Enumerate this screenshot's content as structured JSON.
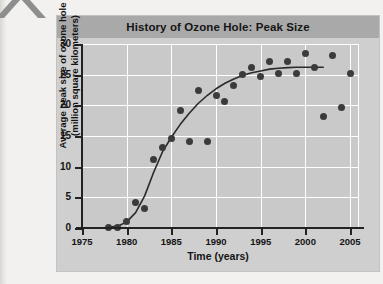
{
  "figure": {
    "title": "History of Ozone Hole: Peak Size",
    "title_band_color": "#a9a9a9",
    "panel_color": "#cfcfcf",
    "plot_color": "#c9c9c9",
    "grid_color": "#ffffff",
    "axis_color": "#222222",
    "marker_color": "#3b3b3b",
    "curve_color": "#2a2a2a"
  },
  "chart_data": {
    "type": "scatter",
    "title": "History of Ozone Hole: Peak Size",
    "xlabel": "Time (years)",
    "ylabel": "Average peak size of ozone hole\n(million square kilometers)",
    "xlim": [
      1975,
      2006
    ],
    "ylim": [
      0,
      30
    ],
    "xticks": [
      1975,
      1980,
      1985,
      1990,
      1995,
      2000,
      2005
    ],
    "yticks": [
      0,
      5,
      10,
      15,
      20,
      25,
      30
    ],
    "xtick_labels": [
      "1975",
      "1980",
      "1985",
      "1990",
      "1995",
      "2000",
      "2005"
    ],
    "ytick_labels": [
      "0",
      "5",
      "10",
      "15",
      "20",
      "25",
      "30"
    ],
    "grid": true,
    "legend": false,
    "series": [
      {
        "name": "Average peak size of ozone hole",
        "x": [
          1978,
          1979,
          1980,
          1981,
          1982,
          1983,
          1984,
          1985,
          1986,
          1987,
          1988,
          1989,
          1990,
          1991,
          1992,
          1993,
          1994,
          1995,
          1996,
          1997,
          1998,
          1999,
          2000,
          2001,
          2002,
          2003,
          2004,
          2005
        ],
        "y": [
          0.1,
          0.1,
          1.1,
          4.2,
          3.2,
          11.1,
          13.1,
          14.6,
          19.2,
          14.1,
          22.5,
          14.1,
          21.6,
          20.6,
          23.2,
          25.1,
          26.1,
          24.7,
          27.1,
          25.2,
          27.1,
          25.2,
          28.5,
          26.1,
          18.2,
          28.2,
          19.7,
          25.2
        ]
      }
    ],
    "fit_curve": {
      "name": "sigmoidal trend line",
      "x": [
        1978,
        1979,
        1980,
        1981,
        1982,
        1983,
        1984,
        1985,
        1986,
        1987,
        1988,
        1989,
        1990,
        1991,
        1992,
        1993,
        1994,
        1995,
        1996,
        1997,
        1998,
        1999,
        2000,
        2001,
        2002
      ],
      "y": [
        0.1,
        0.3,
        1.0,
        2.5,
        5.2,
        9.0,
        12.4,
        14.8,
        16.9,
        18.7,
        20.3,
        21.6,
        22.7,
        23.6,
        24.3,
        24.9,
        25.3,
        25.6,
        25.9,
        26.05,
        26.15,
        26.2,
        26.2,
        26.2,
        26.2
      ]
    }
  },
  "decor": {
    "corner_mark": "caret-arrow-mark"
  }
}
